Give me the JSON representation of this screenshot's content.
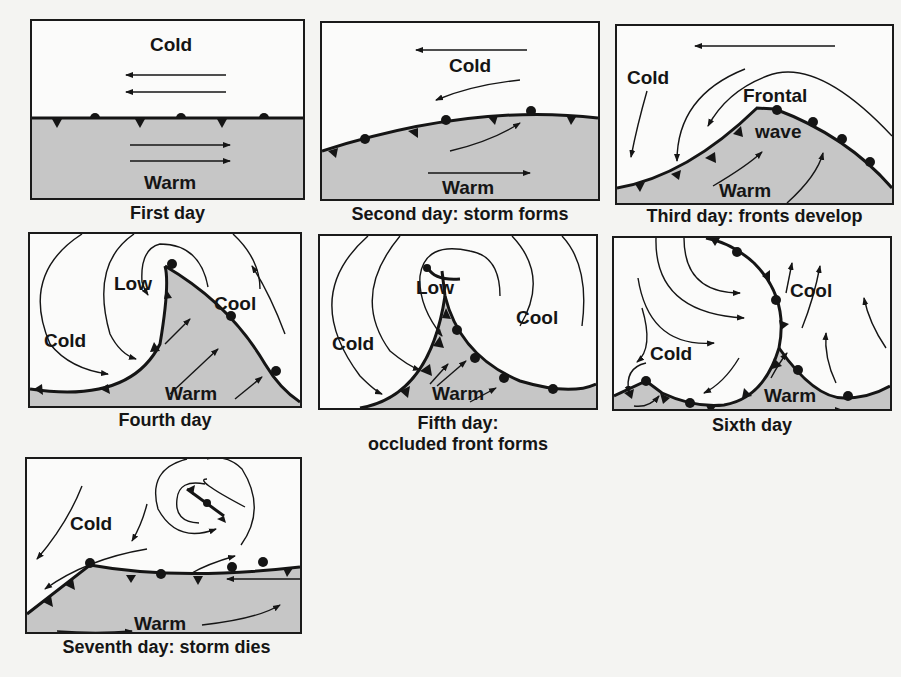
{
  "colors": {
    "warm_fill": "#c6c6c6",
    "line": "#151515",
    "background": "#f4f4f2",
    "panel": "#fbfbfa"
  },
  "panels": [
    {
      "id": "day1",
      "caption": "First day",
      "labels": {
        "cold": "Cold",
        "warm": "Warm"
      }
    },
    {
      "id": "day2",
      "caption": "Second day: storm forms",
      "labels": {
        "cold": "Cold",
        "warm": "Warm"
      }
    },
    {
      "id": "day3",
      "caption": "Third day: fronts develop",
      "labels": {
        "cold": "Cold",
        "frontal": "Frontal",
        "wave": "wave",
        "warm": "Warm"
      }
    },
    {
      "id": "day4",
      "caption": "Fourth day",
      "labels": {
        "low": "Low",
        "cool": "Cool",
        "cold": "Cold",
        "warm": "Warm"
      }
    },
    {
      "id": "day5",
      "caption_line1": "Fifth day:",
      "caption_line2": "occluded front forms",
      "labels": {
        "low": "Low",
        "cool": "Cool",
        "cold": "Cold",
        "warm": "Warm"
      }
    },
    {
      "id": "day6",
      "caption": "Sixth day",
      "labels": {
        "cool": "Cool",
        "cold": "Cold",
        "warm": "Warm"
      }
    },
    {
      "id": "day7",
      "caption": "Seventh day: storm dies",
      "labels": {
        "cold": "Cold",
        "warm": "Warm"
      }
    }
  ]
}
